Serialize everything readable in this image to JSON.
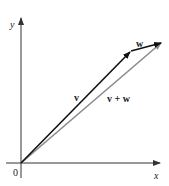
{
  "diagram": {
    "type": "vector-addition",
    "axes": {
      "x_label": "x",
      "y_label": "y",
      "origin_label": "0"
    },
    "vectors": [
      {
        "name": "v",
        "label": "v",
        "from": [
          0,
          0
        ],
        "to": [
          109,
          111
        ],
        "color": "#111111"
      },
      {
        "name": "w",
        "label": "w",
        "from": [
          109,
          111
        ],
        "to": [
          140,
          120
        ],
        "color": "#111111"
      },
      {
        "name": "v+w",
        "label": "v + w",
        "from": [
          0,
          0
        ],
        "to": [
          140,
          120
        ],
        "color": "#8a8a8a"
      }
    ]
  }
}
